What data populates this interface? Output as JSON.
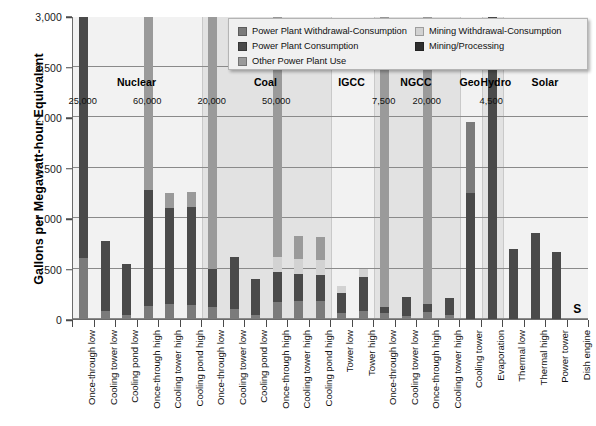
{
  "chart_data": {
    "type": "bar",
    "subtype": "stacked-bar-grouped",
    "title": "",
    "xlabel": "",
    "ylabel": "Gallons per Megawatt-hour Equivalent",
    "ylim": [
      0,
      3000
    ],
    "ytick_labels": [
      "0",
      "500",
      "1,000",
      "1,500",
      "2,000",
      "2,500",
      "3,000"
    ],
    "ytick_values": [
      0,
      500,
      1000,
      1500,
      2000,
      2500,
      3000
    ],
    "grid": true,
    "legend_position": "top-right-inside",
    "series": [
      {
        "name": "Power Plant Withdrawal-Consumption",
        "color": "#7b7b7b"
      },
      {
        "name": "Power Plant Consumption",
        "color": "#4a4a4a"
      },
      {
        "name": "Other Power Plant Use",
        "color": "#9a9a9a"
      },
      {
        "name": "Mining Withdrawal-Consumption",
        "color": "#d2d2d2"
      },
      {
        "name": "Mining/Processing",
        "color": "#2e2e2e"
      }
    ],
    "groups": [
      {
        "label": "Nuclear",
        "categories": [
          {
            "label": "Once-through low",
            "total": 25000,
            "overflow_label": "25,000",
            "stack": [
              {
                "series": 0,
                "value": 600
              },
              {
                "series": 1,
                "value": 2400
              },
              {
                "series": 2,
                "value": 22000
              }
            ]
          },
          {
            "label": "Cooling tower low",
            "total": 770,
            "overflow_label": "",
            "stack": [
              {
                "series": 0,
                "value": 80
              },
              {
                "series": 1,
                "value": 690
              }
            ]
          },
          {
            "label": "Cooling pond low",
            "total": 545,
            "overflow_label": "",
            "stack": [
              {
                "series": 0,
                "value": 40
              },
              {
                "series": 1,
                "value": 505
              }
            ]
          },
          {
            "label": "Once-through high",
            "total": 60000,
            "overflow_label": "60,000",
            "stack": [
              {
                "series": 0,
                "value": 130
              },
              {
                "series": 1,
                "value": 1150
              },
              {
                "series": 2,
                "value": 58720
              }
            ]
          },
          {
            "label": "Cooling tower high",
            "total": 1250,
            "overflow_label": "",
            "stack": [
              {
                "series": 0,
                "value": 150
              },
              {
                "series": 1,
                "value": 950
              },
              {
                "series": 2,
                "value": 150
              }
            ]
          },
          {
            "label": "Cooling pond high",
            "total": 1255,
            "overflow_label": "",
            "stack": [
              {
                "series": 0,
                "value": 140
              },
              {
                "series": 1,
                "value": 965
              },
              {
                "series": 2,
                "value": 150
              }
            ]
          }
        ]
      },
      {
        "label": "Coal",
        "categories": [
          {
            "label": "Once-through low",
            "total": 20000,
            "overflow_label": "20,000",
            "stack": [
              {
                "series": 0,
                "value": 120
              },
              {
                "series": 1,
                "value": 380
              },
              {
                "series": 2,
                "value": 19500
              }
            ]
          },
          {
            "label": "Cooling tower low",
            "total": 610,
            "overflow_label": "",
            "stack": [
              {
                "series": 0,
                "value": 100
              },
              {
                "series": 1,
                "value": 510
              }
            ]
          },
          {
            "label": "Cooling pond low",
            "total": 395,
            "overflow_label": "",
            "stack": [
              {
                "series": 0,
                "value": 40
              },
              {
                "series": 1,
                "value": 355
              }
            ]
          },
          {
            "label": "Once-through high",
            "total": 50000,
            "overflow_label": "50,000",
            "stack": [
              {
                "series": 0,
                "value": 170
              },
              {
                "series": 1,
                "value": 300
              },
              {
                "series": 3,
                "value": 140
              },
              {
                "series": 2,
                "value": 49390
              }
            ]
          },
          {
            "label": "Cooling tower high",
            "total": 820,
            "overflow_label": "",
            "stack": [
              {
                "series": 0,
                "value": 180
              },
              {
                "series": 1,
                "value": 270
              },
              {
                "series": 3,
                "value": 140
              },
              {
                "series": 2,
                "value": 230
              }
            ]
          },
          {
            "label": "Cooling pond high",
            "total": 815,
            "overflow_label": "",
            "stack": [
              {
                "series": 0,
                "value": 180
              },
              {
                "series": 1,
                "value": 260
              },
              {
                "series": 3,
                "value": 145
              },
              {
                "series": 2,
                "value": 230
              }
            ]
          }
        ]
      },
      {
        "label": "IGCC",
        "categories": [
          {
            "label": "Tower low",
            "total": 330,
            "overflow_label": "",
            "stack": [
              {
                "series": 0,
                "value": 60
              },
              {
                "series": 1,
                "value": 195
              },
              {
                "series": 3,
                "value": 75
              }
            ]
          },
          {
            "label": "Tower high",
            "total": 500,
            "overflow_label": "",
            "stack": [
              {
                "series": 0,
                "value": 80
              },
              {
                "series": 1,
                "value": 340
              },
              {
                "series": 3,
                "value": 80
              }
            ]
          }
        ]
      },
      {
        "label": "NGCC",
        "categories": [
          {
            "label": "Once-through low",
            "total": 7500,
            "overflow_label": "7,500",
            "stack": [
              {
                "series": 0,
                "value": 60
              },
              {
                "series": 1,
                "value": 60
              },
              {
                "series": 2,
                "value": 7380
              }
            ]
          },
          {
            "label": "Cooling tower low",
            "total": 215,
            "overflow_label": "",
            "stack": [
              {
                "series": 0,
                "value": 30
              },
              {
                "series": 1,
                "value": 185
              }
            ]
          },
          {
            "label": "Once-through high",
            "total": 20000,
            "overflow_label": "20,000",
            "stack": [
              {
                "series": 0,
                "value": 70
              },
              {
                "series": 1,
                "value": 75
              },
              {
                "series": 2,
                "value": 19855
              }
            ]
          },
          {
            "label": "Cooling tower high",
            "total": 205,
            "overflow_label": "",
            "stack": [
              {
                "series": 0,
                "value": 40
              },
              {
                "series": 1,
                "value": 165
              }
            ]
          }
        ]
      },
      {
        "label": "Geo",
        "categories": [
          {
            "label": "Cooling tower",
            "total": 1950,
            "overflow_label": "",
            "stack": [
              {
                "series": 1,
                "value": 1250
              },
              {
                "series": 0,
                "value": 700
              }
            ]
          }
        ]
      },
      {
        "label": "Hydro",
        "categories": [
          {
            "label": "Evaporation",
            "total": 4500,
            "overflow_label": "4,500",
            "stack": [
              {
                "series": 1,
                "value": 4500
              }
            ]
          }
        ]
      },
      {
        "label": "Solar",
        "categories": [
          {
            "label": "Thermal low",
            "total": 690,
            "overflow_label": "",
            "stack": [
              {
                "series": 1,
                "value": 690
              }
            ]
          },
          {
            "label": "Thermal high",
            "total": 850,
            "overflow_label": "",
            "stack": [
              {
                "series": 1,
                "value": 850
              }
            ]
          },
          {
            "label": "Power tower",
            "total": 665,
            "overflow_label": "",
            "stack": [
              {
                "series": 1,
                "value": 665
              }
            ]
          },
          {
            "label": "Dish engine",
            "total": 0,
            "overflow_label": "",
            "marker": "S",
            "stack": []
          }
        ]
      }
    ]
  },
  "legend": {
    "columns": [
      {
        "items": [
          {
            "label": "Power Plant Withdrawal-Consumption",
            "color": "#7b7b7b"
          },
          {
            "label": "Power Plant Consumption",
            "color": "#4a4a4a"
          },
          {
            "label": "Other Power Plant Use",
            "color": "#9a9a9a"
          }
        ]
      },
      {
        "items": [
          {
            "label": "Mining Withdrawal-Consumption",
            "color": "#d2d2d2"
          },
          {
            "label": "Mining/Processing",
            "color": "#2e2e2e"
          }
        ]
      }
    ]
  }
}
